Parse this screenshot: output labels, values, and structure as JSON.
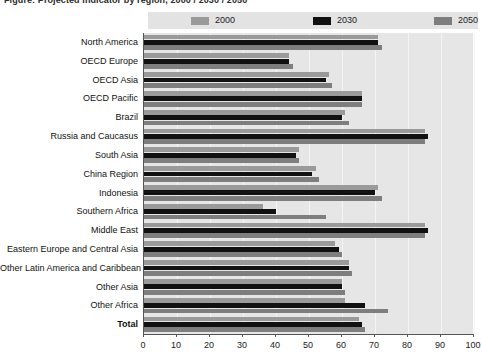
{
  "title": "Figure: Projected indicator by region, 2000 / 2030 / 2050",
  "legend": {
    "position": "top",
    "items": [
      {
        "label": "2000",
        "color": "#9a9a9a",
        "name": "legend-swatch-2000"
      },
      {
        "label": "2030",
        "color": "#111111",
        "name": "legend-swatch-2030"
      },
      {
        "label": "2050",
        "color": "#7e7e7e",
        "name": "legend-swatch-2050"
      }
    ]
  },
  "axis": {
    "x_ticks": [
      "0",
      "10",
      "20",
      "30",
      "40",
      "50",
      "60",
      "70",
      "80",
      "90",
      "100"
    ],
    "xlim": [
      0,
      100
    ]
  },
  "colors": {
    "plot_background": "#e6e6e6",
    "legend_background": "#e3e3e3",
    "gridline": "#f4f4f4",
    "axis": "#555555",
    "series_2000": "#9a9a9a",
    "series_2030": "#111111",
    "series_2050": "#7e7e7e"
  },
  "chart_data": {
    "type": "bar",
    "orientation": "horizontal",
    "title": "Figure: Projected indicator by region, 2000 / 2030 / 2050",
    "xlabel": "",
    "ylabel": "",
    "xlim": [
      0,
      100
    ],
    "grid": true,
    "legend_position": "top",
    "categories": [
      "North America",
      "OECD Europe",
      "OECD Asia",
      "OECD Pacific",
      "Brazil",
      "Russia and Caucasus",
      "South Asia",
      "China Region",
      "Indonesia",
      "Southern Africa",
      "Middle East",
      "Eastern Europe and Central Asia",
      "Other Latin America and Caribbean",
      "Other Asia",
      "Other Africa",
      "Total"
    ],
    "series": [
      {
        "name": "2000",
        "color": "#9a9a9a",
        "values": [
          71,
          44,
          56,
          66,
          61,
          85,
          47,
          52,
          71,
          36,
          85,
          58,
          62,
          60,
          61,
          65
        ]
      },
      {
        "name": "2030",
        "color": "#111111",
        "values": [
          71,
          44,
          55,
          66,
          60,
          86,
          46,
          51,
          70,
          40,
          86,
          59,
          62,
          60,
          67,
          66
        ]
      },
      {
        "name": "2050",
        "color": "#7e7e7e",
        "values": [
          72,
          45,
          57,
          66,
          62,
          85,
          47,
          53,
          72,
          55,
          85,
          60,
          63,
          61,
          74,
          67
        ]
      }
    ]
  }
}
